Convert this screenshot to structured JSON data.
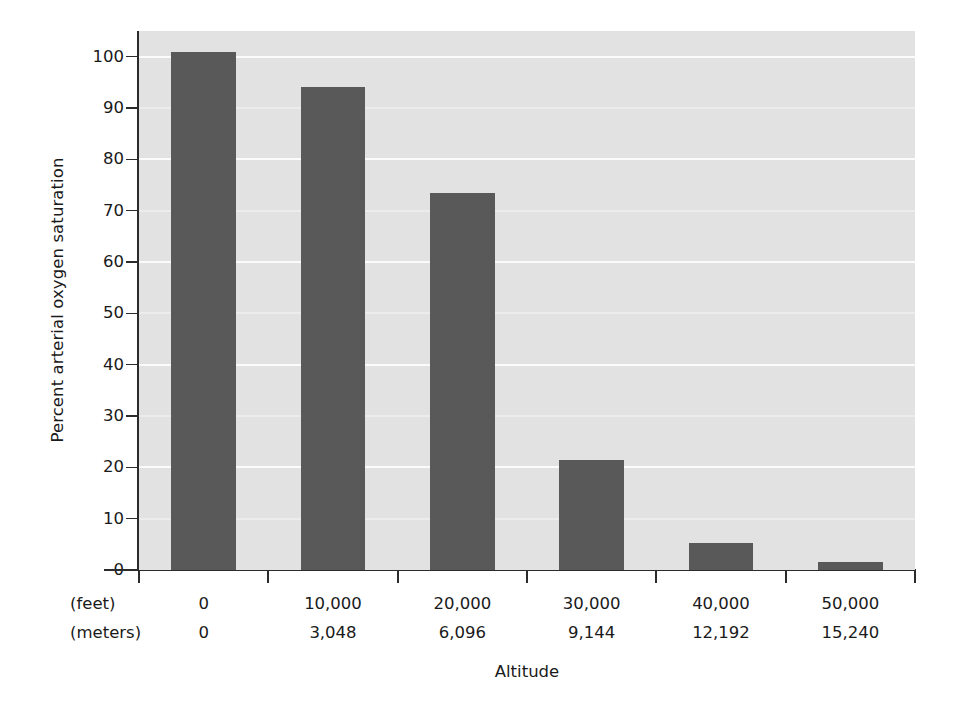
{
  "chart_data": {
    "type": "bar",
    "title": "",
    "subtitle": "",
    "xlabel": "Altitude",
    "ylabel": "Percent arterial oxygen saturation",
    "categories": [
      "0",
      "10,000",
      "20,000",
      "30,000",
      "40,000",
      "50,000"
    ],
    "values": [
      101,
      94,
      73.5,
      21.5,
      5.3,
      1.6
    ],
    "series": [
      {
        "name": "Percent arterial oxygen saturation",
        "values": [
          101,
          94,
          73.5,
          21.5,
          5.3,
          1.6
        ]
      }
    ],
    "ylim": [
      0,
      105
    ],
    "xlim": [
      0,
      6
    ],
    "y_ticks": [
      0,
      10,
      20,
      30,
      40,
      50,
      60,
      70,
      80,
      90,
      100
    ],
    "y_tick_labels": [
      "0",
      "10",
      "20",
      "30",
      "40",
      "50",
      "60",
      "70",
      "80",
      "90",
      "100"
    ],
    "grid": true,
    "grid_axis": "y",
    "legend": false,
    "legend_position": "none",
    "bar_color": "#595959",
    "plot_background": "#e2e2e2",
    "gridline_color": "#fbfbfb",
    "axis_color": "#2b2b2b",
    "figure_background": "#ffffff",
    "x_tick_rows": [
      {
        "row_label": "(feet)",
        "labels": [
          "0",
          "10,000",
          "20,000",
          "30,000",
          "40,000",
          "50,000"
        ]
      },
      {
        "row_label": "(meters)",
        "labels": [
          "0",
          "3,048",
          "6,096",
          "9,144",
          "12,192",
          "15,240"
        ]
      }
    ],
    "annotations": []
  }
}
